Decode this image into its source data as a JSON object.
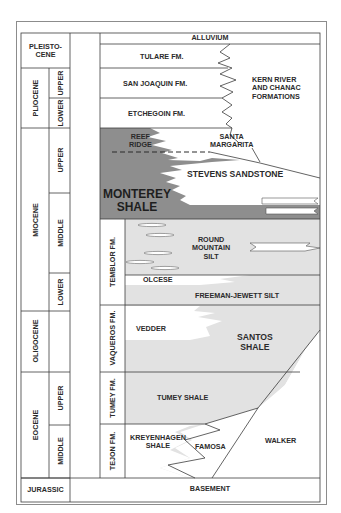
{
  "colors": {
    "monterey_dark": "#8e8e8e",
    "silt_light": "#e2e2e2",
    "line": "#3c3c3c",
    "white": "#ffffff"
  },
  "time_scale": {
    "epochs": [
      {
        "label": "PLEISTO-\nCENE",
        "line1": "PLEISTO-",
        "line2": "CENE"
      },
      {
        "label": "PLIOCENE",
        "subdivisions": [
          "UPPER",
          "LOWER"
        ]
      },
      {
        "label": "MIOCENE",
        "subdivisions": [
          "UPPER",
          "MIDDLE",
          "LOWER"
        ]
      },
      {
        "label": "OLIGOCENE",
        "subdivisions": []
      },
      {
        "label": "EOCENE",
        "subdivisions": [
          "UPPER",
          "MIDDLE"
        ]
      },
      {
        "label": "JURASSIC"
      }
    ]
  },
  "formation_column": [
    "TEMBLOR FM.",
    "VAQUEROS FM.",
    "TUMEY FM.",
    "TEJON FM."
  ],
  "units": {
    "alluvium": "ALLUVIUM",
    "tulare": "TULARE FM.",
    "san_joaquin": "SAN JOAQUIN FM.",
    "etchegoin": "ETCHEGOIN FM.",
    "kern_river": [
      "KERN RIVER",
      "AND CHANAC",
      "FORMATIONS"
    ],
    "reef_ridge": [
      "REEF",
      "RIDGE"
    ],
    "santa_margarita": [
      "SANTA",
      "MARGARITA"
    ],
    "stevens": "STEVENS SANDSTONE",
    "monterey": [
      "MONTEREY",
      "SHALE"
    ],
    "round_mountain": [
      "ROUND",
      "MOUNTAIN",
      "SILT"
    ],
    "olcese": "OLCESE",
    "freeman_jewett": "FREEMAN-JEWETT SILT",
    "vedder": "VEDDER",
    "santos": [
      "SANTOS",
      "SHALE"
    ],
    "tumey_shale": "TUMEY SHALE",
    "kreyenhagen": [
      "KREYENHAGEN",
      "SHALE"
    ],
    "famosa": "FAMOSA",
    "walker": "WALKER",
    "basement": "BASEMENT"
  }
}
